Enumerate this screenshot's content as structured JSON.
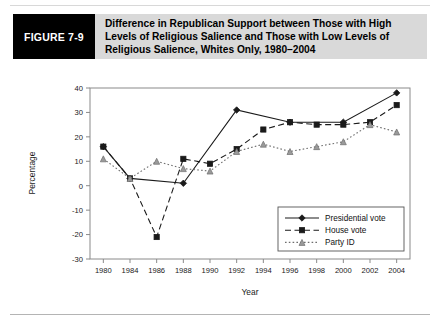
{
  "figure": {
    "tag": "FIGURE 7-9",
    "title": "Difference in Republican Support between Those with High Levels of Religious Salience and Those with Low Levels of Religious Salience, Whites Only, 1980–2004"
  },
  "chart_data": {
    "type": "line",
    "title": "",
    "xlabel": "Year",
    "ylabel": "Percentage",
    "ylim": [
      -30,
      40
    ],
    "yticks": [
      -30,
      -20,
      -10,
      0,
      10,
      20,
      30,
      40
    ],
    "ytick_labels": [
      "-30",
      "-20",
      "-10",
      "0",
      "10",
      "20",
      "30",
      "40"
    ],
    "categories": [
      1980,
      1984,
      1986,
      1988,
      1990,
      1992,
      1994,
      1996,
      1998,
      2000,
      2002,
      2004
    ],
    "xtick_labels": [
      "1980",
      "1984",
      "1986",
      "1988",
      "1990",
      "1992",
      "1994",
      "1996",
      "1998",
      "2000",
      "2002",
      "2004"
    ],
    "grid": false,
    "legend_position": "lower right",
    "series": [
      {
        "name": "Presidential vote",
        "marker": "diamond",
        "linestyle": "solid",
        "color": "#1a1a1a",
        "points": [
          {
            "x": 1980,
            "y": 16
          },
          {
            "x": 1984,
            "y": 3
          },
          {
            "x": 1988,
            "y": 1
          },
          {
            "x": 1992,
            "y": 31
          },
          {
            "x": 1996,
            "y": 26
          },
          {
            "x": 2000,
            "y": 26
          },
          {
            "x": 2004,
            "y": 38
          }
        ]
      },
      {
        "name": "House vote",
        "marker": "square",
        "linestyle": "dashed",
        "color": "#1a1a1a",
        "points": [
          {
            "x": 1980,
            "y": 16
          },
          {
            "x": 1984,
            "y": 3
          },
          {
            "x": 1986,
            "y": -21
          },
          {
            "x": 1988,
            "y": 11
          },
          {
            "x": 1990,
            "y": 9
          },
          {
            "x": 1992,
            "y": 15
          },
          {
            "x": 1994,
            "y": 23
          },
          {
            "x": 1996,
            "y": 26
          },
          {
            "x": 1998,
            "y": 25
          },
          {
            "x": 2000,
            "y": 25
          },
          {
            "x": 2002,
            "y": 26
          },
          {
            "x": 2004,
            "y": 33
          }
        ]
      },
      {
        "name": "Party ID",
        "marker": "triangle",
        "linestyle": "dotted",
        "color": "#6e6e6e",
        "points": [
          {
            "x": 1980,
            "y": 11
          },
          {
            "x": 1984,
            "y": 3
          },
          {
            "x": 1986,
            "y": 10
          },
          {
            "x": 1988,
            "y": 7
          },
          {
            "x": 1990,
            "y": 6
          },
          {
            "x": 1992,
            "y": 14
          },
          {
            "x": 1994,
            "y": 17
          },
          {
            "x": 1996,
            "y": 14
          },
          {
            "x": 1998,
            "y": 16
          },
          {
            "x": 2000,
            "y": 18
          },
          {
            "x": 2002,
            "y": 25
          },
          {
            "x": 2004,
            "y": 22
          }
        ]
      }
    ],
    "legend": [
      "Presidential vote",
      "House vote",
      "Party ID"
    ]
  }
}
